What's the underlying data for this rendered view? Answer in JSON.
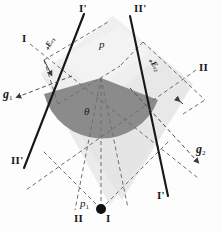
{
  "figure": {
    "colors": {
      "background": "#fdfdfd",
      "band_light": "#e3e3e3",
      "band_lighter": "#ececec",
      "sector_dark": "#8a8a8a",
      "line_solid": "#1a1a1a",
      "line_dashed": "#6a6a6a",
      "text": "#1a1a1a"
    },
    "points": [
      {
        "id": "p",
        "label": "p",
        "x": 101,
        "y": 44,
        "marker": "none"
      },
      {
        "id": "p1",
        "label": "p",
        "sub": "1",
        "x": 83,
        "y": 203,
        "marker": "filled-dot",
        "dot_x": 101,
        "dot_y": 209
      }
    ],
    "angle": {
      "symbol": "θ",
      "x": 86,
      "y": 111
    },
    "line_labels": [
      {
        "id": "line-I-prime-top",
        "text": "I'",
        "x": 79,
        "y": 6
      },
      {
        "id": "line-II-prime-top",
        "text": "II'",
        "x": 135,
        "y": 6
      },
      {
        "id": "line-I-left",
        "text": "I",
        "x": 22,
        "y": 35
      },
      {
        "id": "line-II-right",
        "text": "II",
        "x": 200,
        "y": 64
      },
      {
        "id": "line-II-prime-bottom",
        "text": "II'",
        "x": 12,
        "y": 157
      },
      {
        "id": "line-I-prime-bottom",
        "text": "I'",
        "x": 158,
        "y": 192
      },
      {
        "id": "line-II-bottom",
        "text": "II",
        "x": 75,
        "y": 215
      },
      {
        "id": "line-I-bottom",
        "text": "I",
        "x": 106,
        "y": 215
      }
    ],
    "vectors": [
      {
        "id": "g1",
        "text": "g",
        "sub": "1",
        "x": 4,
        "y": 93,
        "arrow_dir": "left"
      },
      {
        "id": "g2",
        "text": "g",
        "sub": "2",
        "x": 197,
        "y": 148,
        "arrow_dir": "down-right"
      }
    ],
    "edge_labels": [
      {
        "id": "E-eps-1",
        "text": "₊Eₑ₁",
        "x": 46,
        "y": 46,
        "rotate": -62
      },
      {
        "id": "E-eps-2",
        "text": "₊Eₑ₂",
        "x": 150,
        "y": 55,
        "rotate": 55
      }
    ]
  }
}
